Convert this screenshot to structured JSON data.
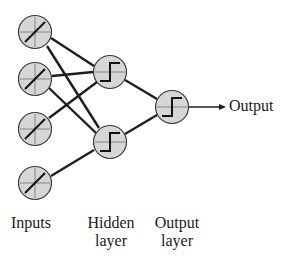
{
  "diagram": {
    "type": "neural-network",
    "labels": {
      "inputs": "Inputs",
      "hidden_line1": "Hidden",
      "hidden_line2": "layer",
      "output_line1": "Output",
      "output_line2": "layer",
      "output_arrow": "Output"
    },
    "layers": [
      {
        "name": "Inputs",
        "activation": "linear",
        "nodes": 4
      },
      {
        "name": "Hidden layer",
        "activation": "step",
        "nodes": 2
      },
      {
        "name": "Output layer",
        "activation": "step",
        "nodes": 1
      }
    ],
    "connections": "fully-connected",
    "colors": {
      "node_fill": "#d6d6d6",
      "node_stroke": "#3a3a3a",
      "edge": "#1e1e1e",
      "text": "#1a1a1a"
    }
  }
}
